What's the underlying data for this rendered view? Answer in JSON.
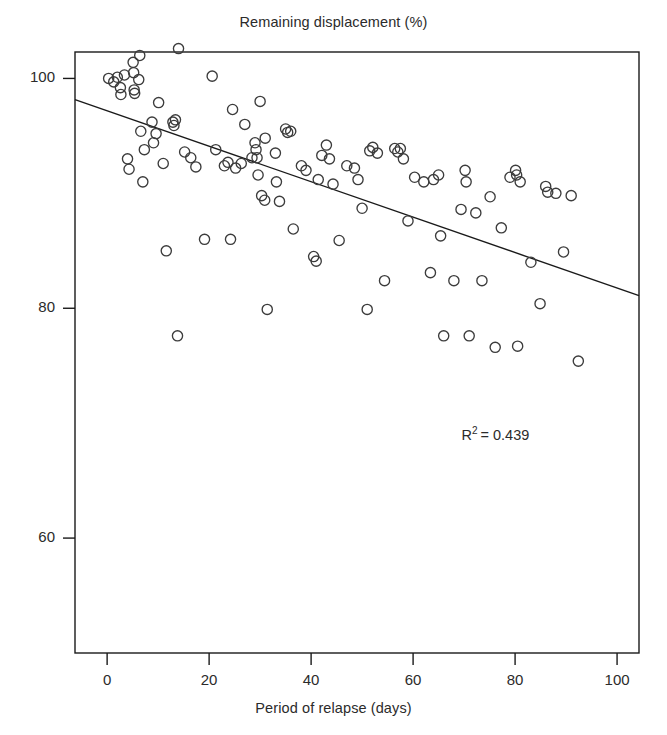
{
  "chart_data": {
    "type": "scatter",
    "title": "Remaining displacement (%)",
    "xlabel": "Period of relapse (days)",
    "ylabel": "",
    "xlim": [
      -6.3,
      104.3
    ],
    "ylim": [
      50.0,
      102.3
    ],
    "xticks": [
      0,
      20,
      40,
      60,
      80,
      100
    ],
    "xtick_labels": [
      "0",
      "20",
      "40",
      "60",
      "80",
      "100"
    ],
    "yticks": [
      60,
      80,
      100
    ],
    "ytick_labels": [
      "60",
      "80",
      "100"
    ],
    "grid": false,
    "legend": null,
    "marker": "open-circle",
    "marker_color": "#3c3c3c",
    "line_color": "#1a1a1a",
    "frame_color": "#1a1a1a",
    "annotations": [
      {
        "text": "R2 = 0.439",
        "display_prefix": "R",
        "display_sup": "2",
        "display_suffix": "= 0.439",
        "x": 69.5,
        "y": 69.0
      }
    ],
    "trendline": {
      "type": "linear",
      "x0": -6.3,
      "y0": 98.15,
      "x1": 104.3,
      "y1": 81.1,
      "slope": -0.154,
      "intercept": 97.18,
      "r_squared": 0.439
    },
    "points": [
      [
        0.3,
        100.0
      ],
      [
        1.3,
        99.7
      ],
      [
        2.0,
        100.1
      ],
      [
        2.6,
        99.2
      ],
      [
        2.7,
        98.6
      ],
      [
        3.4,
        100.3
      ],
      [
        4.0,
        93.0
      ],
      [
        4.3,
        92.1
      ],
      [
        5.1,
        101.4
      ],
      [
        5.2,
        100.5
      ],
      [
        5.3,
        99.0
      ],
      [
        5.4,
        98.7
      ],
      [
        6.2,
        99.9
      ],
      [
        6.4,
        102.0
      ],
      [
        6.6,
        95.4
      ],
      [
        7.0,
        91.0
      ],
      [
        7.3,
        93.8
      ],
      [
        8.8,
        96.2
      ],
      [
        9.1,
        94.4
      ],
      [
        9.6,
        95.2
      ],
      [
        10.1,
        97.9
      ],
      [
        11.0,
        92.6
      ],
      [
        11.6,
        85.0
      ],
      [
        12.9,
        96.2
      ],
      [
        13.1,
        95.9
      ],
      [
        13.4,
        96.4
      ],
      [
        13.8,
        77.6
      ],
      [
        14.0,
        102.6
      ],
      [
        15.2,
        93.6
      ],
      [
        16.4,
        93.1
      ],
      [
        17.4,
        92.3
      ],
      [
        19.1,
        86.0
      ],
      [
        20.6,
        100.2
      ],
      [
        21.3,
        93.8
      ],
      [
        23.0,
        92.4
      ],
      [
        23.7,
        92.7
      ],
      [
        24.2,
        86.0
      ],
      [
        24.6,
        97.3
      ],
      [
        25.2,
        92.2
      ],
      [
        26.3,
        92.6
      ],
      [
        27.0,
        96.0
      ],
      [
        28.4,
        93.1
      ],
      [
        29.0,
        94.4
      ],
      [
        29.2,
        93.8
      ],
      [
        29.4,
        93.1
      ],
      [
        29.6,
        91.6
      ],
      [
        30.0,
        98.0
      ],
      [
        30.3,
        89.8
      ],
      [
        30.9,
        89.4
      ],
      [
        31.0,
        94.8
      ],
      [
        31.4,
        79.9
      ],
      [
        33.0,
        93.5
      ],
      [
        33.2,
        91.0
      ],
      [
        33.8,
        89.3
      ],
      [
        35.0,
        95.6
      ],
      [
        35.4,
        95.3
      ],
      [
        36.0,
        95.4
      ],
      [
        36.5,
        86.9
      ],
      [
        38.1,
        92.4
      ],
      [
        39.0,
        92.0
      ],
      [
        40.5,
        84.5
      ],
      [
        41.0,
        84.1
      ],
      [
        41.4,
        91.2
      ],
      [
        42.1,
        93.3
      ],
      [
        43.0,
        94.2
      ],
      [
        43.6,
        93.0
      ],
      [
        44.3,
        90.8
      ],
      [
        45.5,
        85.9
      ],
      [
        47.0,
        92.4
      ],
      [
        48.5,
        92.2
      ],
      [
        49.2,
        91.2
      ],
      [
        50.0,
        88.7
      ],
      [
        51.0,
        79.9
      ],
      [
        51.5,
        93.7
      ],
      [
        52.1,
        94.0
      ],
      [
        53.0,
        93.5
      ],
      [
        54.4,
        82.4
      ],
      [
        56.4,
        93.9
      ],
      [
        57.0,
        93.6
      ],
      [
        57.5,
        93.9
      ],
      [
        58.1,
        93.0
      ],
      [
        59.0,
        87.6
      ],
      [
        60.3,
        91.4
      ],
      [
        62.1,
        91.0
      ],
      [
        63.4,
        83.1
      ],
      [
        64.0,
        91.2
      ],
      [
        65.0,
        91.6
      ],
      [
        65.4,
        86.3
      ],
      [
        66.0,
        77.6
      ],
      [
        68.0,
        82.4
      ],
      [
        69.4,
        88.6
      ],
      [
        70.2,
        92.0
      ],
      [
        70.4,
        91.0
      ],
      [
        71.0,
        77.6
      ],
      [
        72.3,
        88.3
      ],
      [
        73.5,
        82.4
      ],
      [
        75.1,
        89.7
      ],
      [
        76.1,
        76.6
      ],
      [
        77.3,
        87.0
      ],
      [
        79.0,
        91.4
      ],
      [
        80.1,
        92.0
      ],
      [
        80.3,
        91.6
      ],
      [
        80.5,
        76.7
      ],
      [
        81.0,
        91.0
      ],
      [
        83.1,
        84.0
      ],
      [
        84.9,
        80.4
      ],
      [
        86.0,
        90.6
      ],
      [
        86.4,
        90.1
      ],
      [
        88.0,
        90.0
      ],
      [
        89.5,
        84.9
      ],
      [
        91.0,
        89.8
      ],
      [
        92.4,
        75.4
      ]
    ]
  }
}
